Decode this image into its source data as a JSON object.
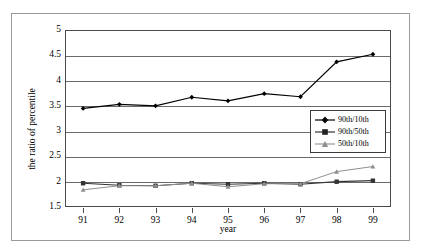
{
  "chart_data": {
    "type": "line",
    "title": "",
    "xlabel": "year",
    "ylabel": "the ratio of percentile",
    "categories": [
      "91",
      "92",
      "93",
      "94",
      "95",
      "96",
      "97",
      "98",
      "99"
    ],
    "x": [
      91,
      92,
      93,
      94,
      95,
      96,
      97,
      98,
      99
    ],
    "ylim": [
      1.5,
      5
    ],
    "yticks": [
      "5",
      "4.5",
      "4",
      "3.5",
      "3",
      "2.5",
      "2",
      "1.5"
    ],
    "ytick_values": [
      5,
      4.5,
      4,
      3.5,
      3,
      2.5,
      2,
      1.5
    ],
    "grid": true,
    "grid_axis": "y",
    "legend_position": "center-right",
    "series": [
      {
        "name": "90th/10th",
        "marker": "diamond",
        "color": "#000000",
        "values": [
          3.45,
          3.53,
          3.5,
          3.67,
          3.6,
          3.74,
          3.68,
          4.37,
          4.52
        ]
      },
      {
        "name": "90th/50th",
        "marker": "square",
        "color": "#333333",
        "values": [
          1.97,
          1.93,
          1.92,
          1.97,
          1.95,
          1.97,
          1.95,
          2.0,
          2.02
        ]
      },
      {
        "name": "50th/10th",
        "marker": "triangle",
        "color": "#8f8f8f",
        "values": [
          1.84,
          1.92,
          1.92,
          1.97,
          1.9,
          1.96,
          1.96,
          2.2,
          2.3
        ]
      }
    ]
  }
}
